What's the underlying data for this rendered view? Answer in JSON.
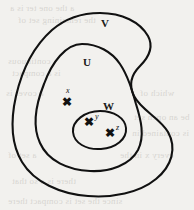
{
  "figure": {
    "kind": "nested-set-venn-diagram",
    "width": 194,
    "height": 210,
    "background_color": "#f2f1ee",
    "ink_color": "#111111"
  },
  "regions": [
    {
      "id": "V",
      "label": "V",
      "role": "outermost-region",
      "label_x": 101,
      "label_y": 17
    },
    {
      "id": "U",
      "label": "U",
      "role": "middle-region",
      "label_x": 83,
      "label_y": 56
    },
    {
      "id": "W",
      "label": "W",
      "role": "innermost-region",
      "label_x": 103,
      "label_y": 100
    }
  ],
  "points": [
    {
      "id": "x",
      "label": "x",
      "mark": "✖",
      "in_region": "U",
      "mark_x": 62,
      "mark_y": 96,
      "label_x": 66,
      "label_y": 87
    },
    {
      "id": "y",
      "label": "y",
      "mark": "✖",
      "in_region": "W",
      "mark_x": 84,
      "mark_y": 116,
      "label_x": 95,
      "label_y": 113
    },
    {
      "id": "z",
      "label": "z",
      "mark": "✖",
      "in_region": "W",
      "mark_x": 105,
      "mark_y": 127,
      "label_x": 116,
      "label_y": 124
    }
  ],
  "background_ghost_text": [
    {
      "text": "a the one ter is a",
      "x": 10,
      "y": 3
    },
    {
      "text": "the remaining set of",
      "x": 18,
      "y": 15
    },
    {
      "text": "continuous",
      "x": 8,
      "y": 56
    },
    {
      "text": "is a compact",
      "x": 12,
      "y": 68
    },
    {
      "text": "a cover is",
      "x": 6,
      "y": 88
    },
    {
      "text": "which of",
      "x": 140,
      "y": 88
    },
    {
      "text": "be an open set",
      "x": 134,
      "y": 112
    },
    {
      "text": "is contained in",
      "x": 132,
      "y": 128
    },
    {
      "text": "a set of",
      "x": 8,
      "y": 150
    },
    {
      "text": "every x in the",
      "x": 120,
      "y": 150
    },
    {
      "text": "there is a so that",
      "x": 12,
      "y": 176
    },
    {
      "text": "since the set is compact there",
      "x": 8,
      "y": 196
    }
  ]
}
